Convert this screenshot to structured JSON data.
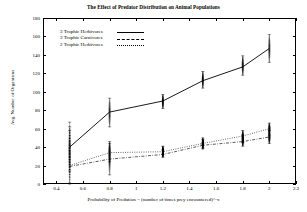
{
  "chart_data": {
    "type": "line",
    "title": "The Effect of Predator Distribution on Animal Populations",
    "xlabel": "Probability of Predation = (number of times prey encountered)^-x",
    "ylabel": "Avg. Number of Organisms",
    "xlim": [
      0.3,
      2.2
    ],
    "ylim": [
      0,
      180
    ],
    "xticks": [
      "0.4",
      "0.6",
      "0.8",
      "1",
      "1.2",
      "1.4",
      "1.6",
      "1.8",
      "2",
      "2.2"
    ],
    "xtick_values": [
      0.4,
      0.6,
      0.8,
      1.0,
      1.2,
      1.4,
      1.6,
      1.8,
      2.0,
      2.2
    ],
    "yticks": [
      "0",
      "20",
      "40",
      "60",
      "80",
      "100",
      "120",
      "140",
      "160",
      "180"
    ],
    "ytick_values": [
      0,
      20,
      40,
      60,
      80,
      100,
      120,
      140,
      160,
      180
    ],
    "grid": false,
    "legend_position": "top-left",
    "x": [
      0.5,
      0.8,
      1.2,
      1.5,
      1.8,
      2.0
    ],
    "series": [
      {
        "name": "3 Trophic Herbivores",
        "style": "solid",
        "values": [
          40,
          78,
          90,
          112,
          127,
          147
        ],
        "scatter_min": [
          14,
          62,
          82,
          104,
          118,
          132
        ],
        "scatter_max": [
          67,
          93,
          97,
          122,
          139,
          162
        ]
      },
      {
        "name": "3 Trophic Carnivores",
        "style": "dash-dot",
        "values": [
          19,
          27,
          32,
          42,
          46,
          51
        ],
        "scatter_min": [
          0,
          10,
          29,
          38,
          41,
          44
        ],
        "scatter_max": [
          58,
          44,
          37,
          48,
          53,
          58
        ]
      },
      {
        "name": "2 Trophic Herbivores",
        "style": "dotted",
        "values": [
          20,
          34,
          35,
          44,
          52,
          60
        ],
        "scatter_min": [
          1,
          24,
          32,
          39,
          45,
          53
        ],
        "scatter_max": [
          62,
          46,
          41,
          50,
          58,
          66
        ]
      }
    ]
  }
}
